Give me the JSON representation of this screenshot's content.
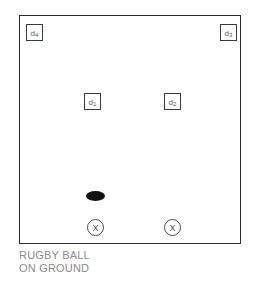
{
  "diagram": {
    "background_color": "#ffffff",
    "frame": {
      "name": "playing-area",
      "border_color": "#2b2b2b"
    },
    "markers": [
      {
        "id": "d4",
        "label_main": "d",
        "label_sub": "4",
        "role": "defender",
        "position": "top-left"
      },
      {
        "id": "d3",
        "label_main": "d",
        "label_sub": "3",
        "role": "defender",
        "position": "top-right"
      },
      {
        "id": "d1",
        "label_main": "d",
        "label_sub": "1",
        "role": "defender",
        "position": "middle-left"
      },
      {
        "id": "d2",
        "label_main": "d",
        "label_sub": "2",
        "role": "defender",
        "position": "middle-right"
      }
    ],
    "ball": {
      "name": "rugby-ball",
      "shape": "ellipse",
      "color": "#111111"
    },
    "players": [
      {
        "id": "player-left",
        "label": "X",
        "role": "attacker"
      },
      {
        "id": "player-right",
        "label": "X",
        "role": "attacker"
      }
    ],
    "caption": {
      "line1": "RUGBY BALL",
      "line2": "ON GROUND",
      "color": "#8a8a8a"
    }
  }
}
